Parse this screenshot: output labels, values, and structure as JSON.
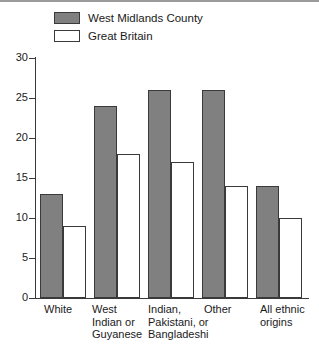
{
  "chart_data": {
    "type": "bar",
    "title": "",
    "subtitle": "",
    "xlabel": "",
    "ylabel": "",
    "ylim": [
      0,
      30
    ],
    "ytick_step": 5,
    "yticks": [
      0,
      5,
      10,
      15,
      20,
      25,
      30
    ],
    "grid": false,
    "legend_position": "top-left",
    "categories": [
      "White",
      "West\nIndian or\nGuyanese",
      "Indian,\nPakistani, or\nBangladeshi",
      "Other",
      "All ethnic\norigins"
    ],
    "series": [
      {
        "name": "West Midlands County",
        "color": "#808080",
        "values": [
          13,
          24,
          26,
          26,
          14
        ]
      },
      {
        "name": "Great Britain",
        "color": "#ffffff",
        "values": [
          9,
          18,
          17,
          14,
          10
        ]
      }
    ]
  },
  "legend": {
    "items": [
      {
        "label": "West Midlands County",
        "swatch": "#808080"
      },
      {
        "label": "Great Britain",
        "swatch": "#ffffff"
      }
    ]
  },
  "axis": {
    "y_tick_labels": [
      "30",
      "25",
      "20",
      "15",
      "10",
      "5",
      "0"
    ]
  }
}
